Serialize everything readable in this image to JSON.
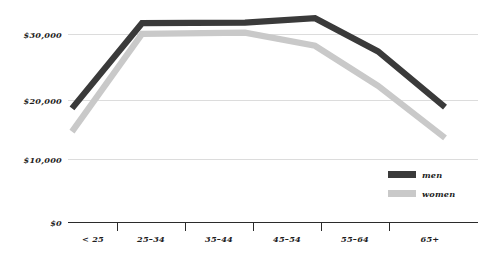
{
  "chart_data": {
    "type": "line",
    "title": "",
    "subtitle": "",
    "xlabel": "",
    "ylabel": "",
    "categories": [
      "< 25",
      "25–34",
      "35–44",
      "45–54",
      "55–64",
      "65+"
    ],
    "series": [
      {
        "name": "men",
        "color": "#3a3a3a",
        "values": [
          18200,
          31800,
          31900,
          32600,
          27300,
          18400
        ]
      },
      {
        "name": "women",
        "color": "#c9c9c9",
        "values": [
          14500,
          30100,
          30300,
          28200,
          21800,
          13500
        ]
      }
    ],
    "ylim": [
      0,
      36000
    ],
    "yticks": [
      0,
      10000,
      20000,
      30000
    ],
    "ytick_labels": [
      "$0",
      "$10,000",
      "$20,000",
      "$30,000"
    ],
    "grid": true,
    "grid_axis": "y",
    "legend_position": "bottom-right",
    "legend_entries": [
      {
        "label": "men",
        "color": "#3a3a3a"
      },
      {
        "label": "women",
        "color": "#c9c9c9"
      }
    ]
  },
  "colors": {
    "background": "#ffffff",
    "grid": "#dcdcdc",
    "axis": "#2b2b2b",
    "text": "#1d1d1d",
    "men": "#3a3a3a",
    "women": "#c9c9c9"
  }
}
